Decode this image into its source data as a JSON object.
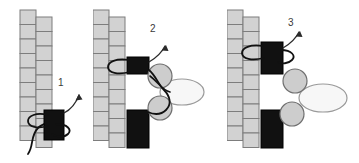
{
  "figure": {
    "type": "diagram",
    "title": "",
    "background_color": "#ffffff",
    "width": 359,
    "height": 163,
    "panel_count": 3
  },
  "palette": {
    "brick_fill": "#d2d2d2",
    "brick_stroke": "#7d7d7d",
    "dark_block_fill": "#111111",
    "dark_block_stroke": "#000000",
    "circle_fill": "#cdcdcd",
    "circle_stroke": "#6f6f6f",
    "ellipse_fill": "#f7f7f7",
    "ellipse_stroke": "#9a9a9a",
    "thread_stroke": "#111111",
    "label_color": "#3a3a3a"
  },
  "panels": [
    {
      "id": "panel-1",
      "label": "1",
      "label_x": 58,
      "label_y": 78,
      "columns": [
        {
          "name": "left-column",
          "x": 20,
          "y": 10,
          "brick_w": 16,
          "brick_h": 14.5,
          "count": 9
        },
        {
          "name": "right-column",
          "x": 36,
          "y": 17,
          "brick_w": 16,
          "brick_h": 14.5,
          "count": 9
        }
      ],
      "dark_blocks": [
        {
          "name": "dark-block-lower",
          "x": 44,
          "y": 110,
          "w": 20,
          "h": 30
        }
      ],
      "circles": [],
      "ellipses": [],
      "arrow": {
        "from_x": 66,
        "from_y": 112,
        "to_x": 80,
        "to_y": 93
      },
      "threads": 2
    },
    {
      "id": "panel-2",
      "label": "2",
      "label_x": 150,
      "label_y": 28,
      "columns": [
        {
          "name": "left-column",
          "x": 93,
          "y": 10,
          "brick_w": 16,
          "brick_h": 14.5,
          "count": 9
        },
        {
          "name": "right-column",
          "x": 109,
          "y": 17,
          "brick_w": 16,
          "brick_h": 14.5,
          "count": 9
        }
      ],
      "dark_blocks": [
        {
          "name": "dark-block-upper",
          "x": 127,
          "y": 57,
          "w": 22,
          "h": 17
        },
        {
          "name": "dark-block-lower",
          "x": 127,
          "y": 110,
          "w": 22,
          "h": 38
        }
      ],
      "circles": [
        {
          "name": "nucleosome-upper",
          "cx": 160,
          "cy": 76,
          "r": 12
        },
        {
          "name": "nucleosome-lower",
          "cx": 160,
          "cy": 108,
          "r": 12
        }
      ],
      "ellipses": [
        {
          "name": "large-complex",
          "cx": 182,
          "cy": 92,
          "rx": 22,
          "ry": 13
        }
      ],
      "arrow": {
        "from_x": 150,
        "from_y": 62,
        "to_x": 166,
        "to_y": 45
      },
      "threads": 2
    },
    {
      "id": "panel-3",
      "label": "3",
      "label_x": 288,
      "label_y": 22,
      "columns": [
        {
          "name": "left-column",
          "x": 227,
          "y": 10,
          "brick_w": 16,
          "brick_h": 14.5,
          "count": 9
        },
        {
          "name": "right-column",
          "x": 243,
          "y": 17,
          "brick_w": 16,
          "brick_h": 14.5,
          "count": 9
        }
      ],
      "dark_blocks": [
        {
          "name": "dark-block-upper",
          "x": 261,
          "y": 42,
          "w": 22,
          "h": 32
        },
        {
          "name": "dark-block-lower",
          "x": 261,
          "y": 110,
          "w": 22,
          "h": 38
        }
      ],
      "circles": [
        {
          "name": "nucleosome-upper",
          "cx": 295,
          "cy": 81,
          "r": 12
        },
        {
          "name": "nucleosome-lower",
          "cx": 292,
          "cy": 114,
          "r": 12
        }
      ],
      "ellipses": [
        {
          "name": "large-complex",
          "cx": 323,
          "cy": 98,
          "rx": 24,
          "ry": 14
        }
      ],
      "arrow": {
        "from_x": 283,
        "from_y": 48,
        "to_x": 299,
        "to_y": 31
      },
      "threads": 2
    }
  ]
}
